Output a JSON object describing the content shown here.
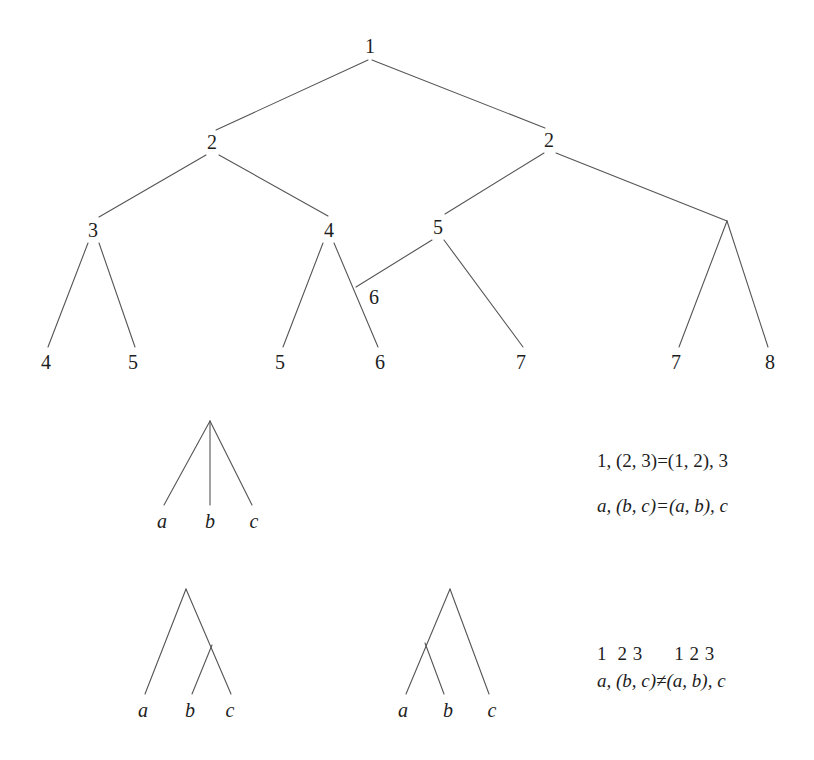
{
  "figure": {
    "background_color": "#ffffff",
    "line_color": "#555555",
    "text_color": "#1d1d1d"
  },
  "tree_numbered": {
    "caption": "numbered-derivation-tree",
    "nodes": [
      {
        "id": "root",
        "label": "1",
        "x": 370,
        "y": 46
      },
      {
        "id": "l2-left",
        "label": "2",
        "x": 212,
        "y": 142
      },
      {
        "id": "l2-right",
        "label": "2",
        "x": 549,
        "y": 140
      },
      {
        "id": "l3-three",
        "label": "3",
        "x": 93,
        "y": 230
      },
      {
        "id": "l3-four",
        "label": "4",
        "x": 329,
        "y": 230
      },
      {
        "id": "l3-five",
        "label": "5",
        "x": 438,
        "y": 227
      },
      {
        "id": "l3-six",
        "label": "6",
        "x": 374,
        "y": 297
      },
      {
        "id": "leaf-four",
        "label": "4",
        "x": 46,
        "y": 362
      },
      {
        "id": "leaf-five-a",
        "label": "5",
        "x": 133,
        "y": 362
      },
      {
        "id": "leaf-five-b",
        "label": "5",
        "x": 280,
        "y": 362
      },
      {
        "id": "leaf-six",
        "label": "6",
        "x": 380,
        "y": 362
      },
      {
        "id": "leaf-seven-a",
        "label": "7",
        "x": 521,
        "y": 362
      },
      {
        "id": "leaf-seven-b",
        "label": "7",
        "x": 676,
        "y": 362
      },
      {
        "id": "leaf-eight",
        "label": "8",
        "x": 770,
        "y": 362
      }
    ],
    "edges": [
      {
        "from": "root",
        "to": "l2-left",
        "x1": 368,
        "y1": 60,
        "x2": 216,
        "y2": 130
      },
      {
        "from": "root",
        "to": "l2-right",
        "x1": 372,
        "y1": 60,
        "x2": 545,
        "y2": 128
      },
      {
        "from": "l2-left",
        "to": "l3-three",
        "x1": 206,
        "y1": 155,
        "x2": 99,
        "y2": 217
      },
      {
        "from": "l2-left",
        "to": "l3-four",
        "x1": 219,
        "y1": 155,
        "x2": 328,
        "y2": 216
      },
      {
        "from": "l2-right",
        "to": "l3-five",
        "x1": 544,
        "y1": 153,
        "x2": 445,
        "y2": 214
      },
      {
        "from": "l2-right",
        "to": "junction-right",
        "x1": 556,
        "y1": 153,
        "x2": 727,
        "y2": 221
      },
      {
        "from": "l3-three",
        "to": "leaf-four",
        "x1": 88,
        "y1": 243,
        "x2": 48,
        "y2": 347
      },
      {
        "from": "l3-three",
        "to": "leaf-five-a",
        "x1": 99,
        "y1": 243,
        "x2": 135,
        "y2": 347
      },
      {
        "from": "l3-four",
        "to": "leaf-five-b",
        "x1": 323,
        "y1": 243,
        "x2": 283,
        "y2": 347
      },
      {
        "from": "l3-four",
        "to": "leaf-six",
        "x1": 334,
        "y1": 243,
        "x2": 378,
        "y2": 347
      },
      {
        "from": "l3-five",
        "to": "node-six",
        "x1": 432,
        "y1": 240,
        "x2": 356,
        "y2": 287
      },
      {
        "from": "l3-five",
        "to": "leaf-seven-a",
        "x1": 444,
        "y1": 240,
        "x2": 523,
        "y2": 347
      },
      {
        "from": "junction-right",
        "to": "leaf-seven-b",
        "x1": 727,
        "y1": 221,
        "x2": 679,
        "y2": 347
      },
      {
        "from": "junction-right",
        "to": "leaf-eight",
        "x1": 727,
        "y1": 221,
        "x2": 768,
        "y2": 347
      }
    ]
  },
  "tree_flat": {
    "caption": "flat-ternary-tree",
    "apex": {
      "x": 210,
      "y": 421
    },
    "leaves": [
      {
        "label": "a",
        "x": 162,
        "y": 521,
        "tip_x": 164,
        "tip_y": 505
      },
      {
        "label": "b",
        "x": 210,
        "y": 521,
        "tip_x": 210,
        "tip_y": 505
      },
      {
        "label": "c",
        "x": 254,
        "y": 521,
        "tip_x": 252,
        "tip_y": 505
      }
    ]
  },
  "tree_right_branching": {
    "caption": "right-branching-tree",
    "apex": {
      "x": 186,
      "y": 589
    },
    "inner": {
      "x": 212,
      "y": 645
    },
    "leaves": [
      {
        "label": "a",
        "x": 143,
        "y": 710,
        "tip_x": 145,
        "tip_y": 694
      },
      {
        "label": "b",
        "x": 190,
        "y": 710,
        "tip_x": 192,
        "tip_y": 694
      },
      {
        "label": "c",
        "x": 230,
        "y": 710,
        "tip_x": 231,
        "tip_y": 694
      }
    ]
  },
  "tree_left_branching": {
    "caption": "left-branching-tree",
    "apex": {
      "x": 450,
      "y": 589
    },
    "inner": {
      "x": 425,
      "y": 643
    },
    "leaves": [
      {
        "label": "a",
        "x": 403,
        "y": 710,
        "tip_x": 406,
        "tip_y": 694
      },
      {
        "label": "b",
        "x": 448,
        "y": 710,
        "tip_x": 444,
        "tip_y": 694
      },
      {
        "label": "c",
        "x": 492,
        "y": 710,
        "tip_x": 489,
        "tip_y": 694
      }
    ]
  },
  "annotations": {
    "assoc_numeric": "1, (2, 3)=(1, 2), 3",
    "assoc_symbolic": "a, (b, c)=(a, b), c",
    "order_numeric": "1  2 3      1 2 3",
    "order_symbolic": "a, (b, c)≠(a, b), c"
  }
}
